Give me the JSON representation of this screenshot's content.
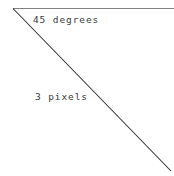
{
  "figure": {
    "background_color": "#ffffff",
    "width": 174,
    "height": 176,
    "origin_x": 13,
    "origin_y": 8
  },
  "labels": {
    "angle": "45 degrees",
    "length": "3 pixels"
  },
  "lines": {
    "horizontal": {
      "name": "horizontal reference line",
      "color": "#808080",
      "stroke_width": 1.1,
      "x1": 13,
      "y1": 8.5,
      "x2": 174,
      "y2": 8.5
    },
    "diagonal": {
      "name": "45 degree diagonal line",
      "color": "#2b2b2b",
      "stroke_width": 1.05,
      "x1": 13,
      "y1": 8.5,
      "x2": 171,
      "y2": 171
    }
  },
  "chart_data": {
    "type": "line",
    "title": "45 degrees",
    "xlabel": "",
    "ylabel": "",
    "annotations": [
      "45 degrees",
      "3 pixels"
    ],
    "series": [
      {
        "name": "horizontal reference line",
        "x": [
          13,
          174
        ],
        "y": [
          8.5,
          8.5
        ],
        "color": "#808080"
      },
      {
        "name": "45 degree diagonal line",
        "x": [
          13,
          171
        ],
        "y": [
          8.5,
          171
        ],
        "color": "#2b2b2b"
      }
    ],
    "xlim": [
      0,
      174
    ],
    "ylim": [
      176,
      0
    ],
    "grid": false,
    "legend": "none"
  }
}
